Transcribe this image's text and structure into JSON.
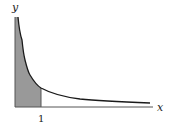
{
  "diagram": {
    "title": "",
    "axes": {
      "x_label": "x",
      "y_label": "y",
      "x_tick_labels": [
        "1"
      ]
    },
    "curve": {
      "description": "decreasing curve asymptotic to both axes (y = 1/sqrt(x) style)",
      "color": "#1a1a1a"
    },
    "shaded_region": {
      "from": "0",
      "to": "1",
      "color": "#999999"
    },
    "colors": {
      "axis": "#555555",
      "shade": "#999999",
      "curve": "#1a1a1a"
    }
  }
}
